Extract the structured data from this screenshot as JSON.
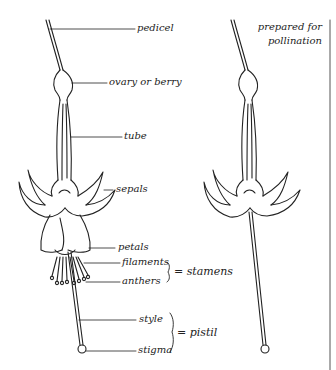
{
  "diagram": {
    "labels": {
      "pedicel": "pedicel",
      "ovary": "ovary or berry",
      "tube": "tube",
      "sepals": "sepals",
      "petals": "petals",
      "filaments": "filaments",
      "anthers": "anthers",
      "style": "style",
      "stigma": "stigma"
    },
    "groups": {
      "stamens": "= stamens",
      "pistil": "= pistil"
    },
    "caption": {
      "line1": "prepared for",
      "line2": "pollination"
    },
    "colors": {
      "ink": "#222222",
      "background": "#ffffff"
    }
  }
}
